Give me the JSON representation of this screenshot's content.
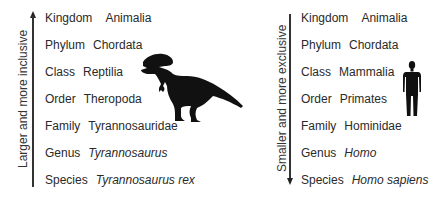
{
  "left": {
    "axis_label": "Larger and more inclusive",
    "arrow_direction": "up",
    "organism_icon": "tyrannosaurus-silhouette",
    "rows": [
      {
        "rank": "Kingdom",
        "name": "Animalia",
        "italic": false
      },
      {
        "rank": "Phylum",
        "name": "Chordata",
        "italic": false
      },
      {
        "rank": "Class",
        "name": "Reptilia",
        "italic": false
      },
      {
        "rank": "Order",
        "name": "Theropoda",
        "italic": false
      },
      {
        "rank": "Family",
        "name": "Tyrannosauridae",
        "italic": false
      },
      {
        "rank": "Genus",
        "name": "Tyrannosaurus",
        "italic": true
      },
      {
        "rank": "Species",
        "name": "Tyrannosaurus rex",
        "italic": true
      }
    ]
  },
  "right": {
    "axis_label": "Smaller and more exclusive",
    "arrow_direction": "down",
    "organism_icon": "human-silhouette",
    "rows": [
      {
        "rank": "Kingdom",
        "name": "Animalia",
        "italic": false
      },
      {
        "rank": "Phylum",
        "name": "Chordata",
        "italic": false
      },
      {
        "rank": "Class",
        "name": "Mammalia",
        "italic": false
      },
      {
        "rank": "Order",
        "name": "Primates",
        "italic": false
      },
      {
        "rank": "Family",
        "name": "Hominidae",
        "italic": false
      },
      {
        "rank": "Genus",
        "name": "Homo",
        "italic": true
      },
      {
        "rank": "Species",
        "name": "Homo sapiens",
        "italic": true
      }
    ]
  }
}
